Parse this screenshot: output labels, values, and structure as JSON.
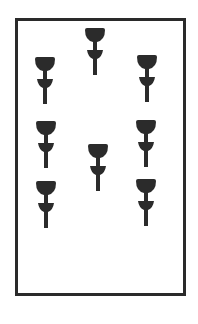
{
  "card": {
    "name": "Seven of Cups",
    "suit": "cups",
    "count": 7,
    "border_color": "#2a2a2a",
    "pip_color": "#2b2b2b",
    "pips": [
      {
        "id": "top-center",
        "x": 84,
        "y": 28
      },
      {
        "id": "left-upper",
        "x": 34,
        "y": 57
      },
      {
        "id": "right-upper",
        "x": 136,
        "y": 55
      },
      {
        "id": "left-middle",
        "x": 35,
        "y": 121
      },
      {
        "id": "right-middle",
        "x": 135,
        "y": 120
      },
      {
        "id": "center",
        "x": 87,
        "y": 144
      },
      {
        "id": "left-lower",
        "x": 35,
        "y": 181
      },
      {
        "id": "right-lower",
        "x": 135,
        "y": 179
      }
    ]
  }
}
